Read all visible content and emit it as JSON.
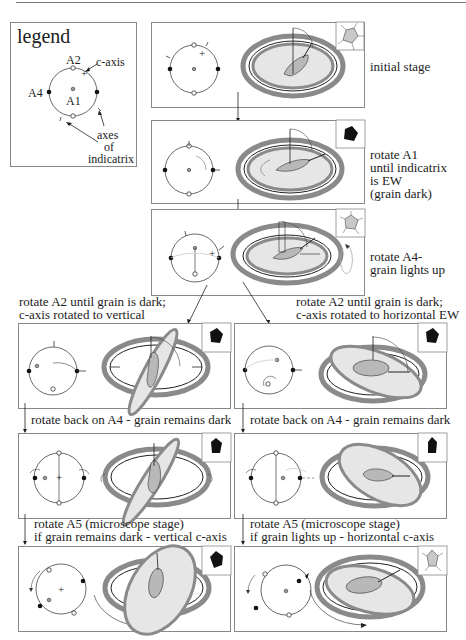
{
  "figure": {
    "legend": {
      "title": "legend",
      "labels": {
        "a2": "A2",
        "a4": "A4",
        "a1": "A1",
        "c_axis": "c-axis",
        "indicatrix_1": "axes",
        "indicatrix_2": "of",
        "indicatrix_3": "indicatrix"
      }
    },
    "stages": [
      {
        "id": "initial",
        "caption": [
          "initial stage"
        ],
        "grain_state": "light"
      },
      {
        "id": "rotate-a1",
        "caption": [
          "rotate A1",
          "until indicatrix",
          "is EW",
          "(grain  dark)"
        ],
        "grain_state": "dark"
      },
      {
        "id": "rotate-a4",
        "caption": [
          "rotate A4-",
          "grain lights up"
        ],
        "grain_state": "light"
      }
    ],
    "branches": {
      "left": {
        "step1_caption": [
          "rotate A2 until grain is dark;",
          "c-axis rotated to  vertical"
        ],
        "step2_caption": "rotate back on A4 - grain remains dark",
        "step3_caption": [
          "rotate A5  (microscope stage)",
          "if grain remains dark - vertical c-axis"
        ],
        "grain_states": [
          "dark",
          "dark",
          "dark"
        ]
      },
      "right": {
        "step1_caption": [
          "rotate A2 until grain is dark;",
          "c-axis rotated to horizontal EW"
        ],
        "step2_caption": "rotate back on A4 - grain remains dark",
        "step3_caption": [
          "rotate A5  (microscope stage)",
          "if grain lights up - horizontal c-axis"
        ],
        "grain_states": [
          "dark",
          "dark",
          "light"
        ]
      }
    },
    "colors": {
      "stroke": "#333333",
      "ring_gray": "#8a8a8a",
      "fill_light": "#e6e6e6",
      "grain_gray": "#b8b8b8",
      "grain_dark": "#111111",
      "box_border": "#888888"
    }
  }
}
